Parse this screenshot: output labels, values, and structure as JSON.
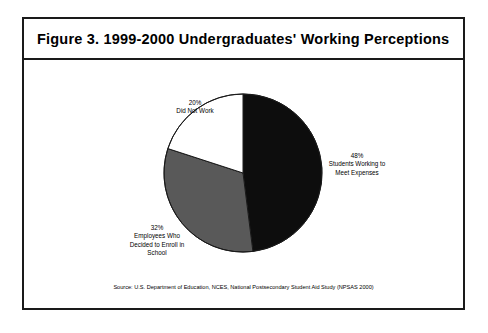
{
  "figure": {
    "title": "Figure 3.   1999-2000 Undergraduates' Working Perceptions",
    "source_note": "Source:  U.S. Department of Education, NCES, National Postsecondary Student Aid Study (NPSAS 2000)"
  },
  "labels": {
    "did_not_work": {
      "percent": "20%",
      "line1": "Did Not Work"
    },
    "meet_expenses": {
      "percent": "48%",
      "line1": "Students Working to",
      "line2": "Meet Expenses"
    },
    "enroll_school": {
      "percent": "32%",
      "line1": "Employees Who",
      "line2": "Decided to Enroll in",
      "line3": "School"
    }
  },
  "colors": {
    "slice_black": "#0d0d0d",
    "slice_gray": "#595959",
    "slice_white": "#ffffff",
    "outline": "#1a1a1a",
    "frame": "#1a1a1a"
  },
  "chart_data": {
    "type": "pie",
    "title": "Figure 3.   1999-2000 Undergraduates' Working Perceptions",
    "xlabel": "",
    "ylabel": "",
    "grid": false,
    "legend": "none",
    "start_angle_deg": 0,
    "direction": "clockwise",
    "center_px": [
      241,
      171
    ],
    "radius_px": 79,
    "categories": [
      "Students Working to Meet Expenses",
      "Employees Who Decided to Enroll in School",
      "Did Not Work"
    ],
    "values": [
      48,
      32,
      20
    ],
    "value_labels": [
      "48%",
      "32%",
      "20%"
    ],
    "slice_colors": [
      "#0d0d0d",
      "#595959",
      "#ffffff"
    ],
    "slice_angles_deg": [
      172.8,
      115.2,
      72.0
    ],
    "units": "percent of undergraduates",
    "total": 100,
    "annotations": [
      "Source:  U.S. Department of Education, NCES, National Postsecondary Student Aid Study (NPSAS 2000)"
    ]
  }
}
